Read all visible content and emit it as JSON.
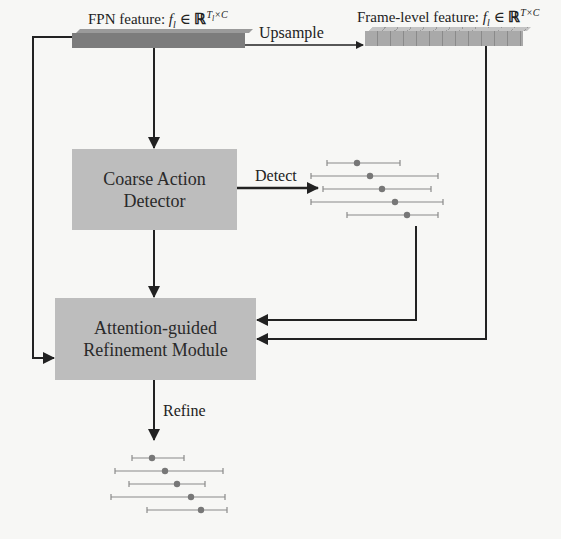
{
  "features": {
    "fpn": {
      "label_prefix": "FPN feature: ",
      "math": "f_l ∈ ℝ^{T_l×C}",
      "sym": "f",
      "sub": "l",
      "in": " ∈ ",
      "R": "ℝ",
      "sup": "T",
      "sup_sub": "l",
      "sup_tail": "×C"
    },
    "frame": {
      "label_prefix": "Frame-level feature: ",
      "math": "f_l ∈ ℝ^{T×C}",
      "sym": "f",
      "sub": "l",
      "in": " ∈ ",
      "R": "ℝ",
      "sup": "T×C"
    }
  },
  "edges": {
    "upsample": "Upsample",
    "detect": "Detect",
    "refine": "Refine"
  },
  "modules": {
    "coarse_detector": {
      "line1": "Coarse Action",
      "line2": "Detector"
    },
    "refinement": {
      "line1": "Attention-guided",
      "line2": "Refinement Module"
    }
  },
  "colors": {
    "box_fill": "#bdbdbd",
    "fpn_bar": "#7c7c7c",
    "frame_bar": "#a9a9a9",
    "interval_line": "#8a8a8a",
    "interval_dot": "#777777",
    "arrow": "#222222"
  },
  "coarse_intervals": [
    {
      "start": 327,
      "center": 357,
      "end": 400,
      "y": 163
    },
    {
      "start": 311,
      "center": 370,
      "end": 438,
      "y": 176
    },
    {
      "start": 323,
      "center": 382,
      "end": 431,
      "y": 189
    },
    {
      "start": 311,
      "center": 395,
      "end": 443,
      "y": 202
    },
    {
      "start": 347,
      "center": 407,
      "end": 438,
      "y": 215
    }
  ],
  "refined_intervals": [
    {
      "start": 132,
      "center": 152,
      "end": 184,
      "y": 458
    },
    {
      "start": 115,
      "center": 165,
      "end": 223,
      "y": 471
    },
    {
      "start": 129,
      "center": 177,
      "end": 205,
      "y": 484
    },
    {
      "start": 111,
      "center": 191,
      "end": 225,
      "y": 497
    },
    {
      "start": 147,
      "center": 201,
      "end": 227,
      "y": 510
    }
  ]
}
